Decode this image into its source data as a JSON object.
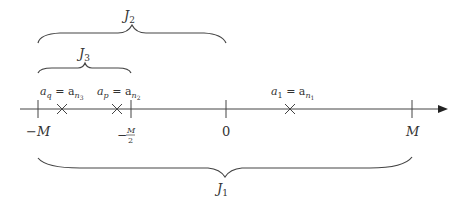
{
  "diagram": {
    "type": "number-line",
    "ticks": [
      {
        "id": "neg-M",
        "label": "−M",
        "value": -1.0
      },
      {
        "id": "neg-half-M",
        "label_num": "M",
        "label_den": "2",
        "label_sign": "−",
        "value": -0.5
      },
      {
        "id": "zero",
        "label": "0",
        "value": 0.0
      },
      {
        "id": "M",
        "label": "M",
        "value": 1.0
      }
    ],
    "points": [
      {
        "id": "aq",
        "label_main": "a",
        "label_sub": "q",
        "label_eq": " = a",
        "label_sub2": "n",
        "label_sub3": "3",
        "value": -0.87
      },
      {
        "id": "ap",
        "label_main": "a",
        "label_sub": "p",
        "label_eq": " = a",
        "label_sub2": "n",
        "label_sub3": "2",
        "value": -0.58
      },
      {
        "id": "a1",
        "label_main": "a",
        "label_sub": "1",
        "label_eq": " = a",
        "label_sub2": "n",
        "label_sub3": "1",
        "value": 0.34
      }
    ],
    "braces": [
      {
        "id": "J2",
        "label": "J",
        "sub": "2",
        "from": -1.0,
        "to": 0.0
      },
      {
        "id": "J3",
        "label": "J",
        "sub": "3",
        "from": -1.0,
        "to": -0.5
      },
      {
        "id": "J1",
        "label": "J",
        "sub": "1",
        "from": -1.0,
        "to": 1.0
      }
    ]
  }
}
